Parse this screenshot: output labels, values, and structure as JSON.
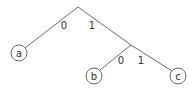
{
  "diagram": {
    "type": "binary-code-tree",
    "nodes": [
      {
        "id": "root",
        "x": 78,
        "y": 7,
        "kind": "internal"
      },
      {
        "id": "n1",
        "x": 131,
        "y": 45,
        "kind": "internal"
      },
      {
        "id": "a",
        "label": "a",
        "x": 19,
        "y": 53,
        "kind": "leaf"
      },
      {
        "id": "b",
        "label": "b",
        "x": 94,
        "y": 76,
        "kind": "leaf"
      },
      {
        "id": "c",
        "label": "c",
        "x": 178,
        "y": 76,
        "kind": "leaf"
      }
    ],
    "edges": [
      {
        "from": "root",
        "to": "a",
        "label": "0",
        "lx": 64,
        "ly": 25
      },
      {
        "from": "root",
        "to": "n1",
        "label": "1",
        "lx": 92,
        "ly": 25
      },
      {
        "from": "n1",
        "to": "b",
        "label": "0",
        "lx": 121,
        "ly": 60
      },
      {
        "from": "n1",
        "to": "c",
        "label": "1",
        "lx": 141,
        "ly": 60
      }
    ],
    "leaf_radius": 8,
    "colors": {
      "line": "#6b6b6b",
      "text": "#333333",
      "background": "#ffffff"
    }
  }
}
